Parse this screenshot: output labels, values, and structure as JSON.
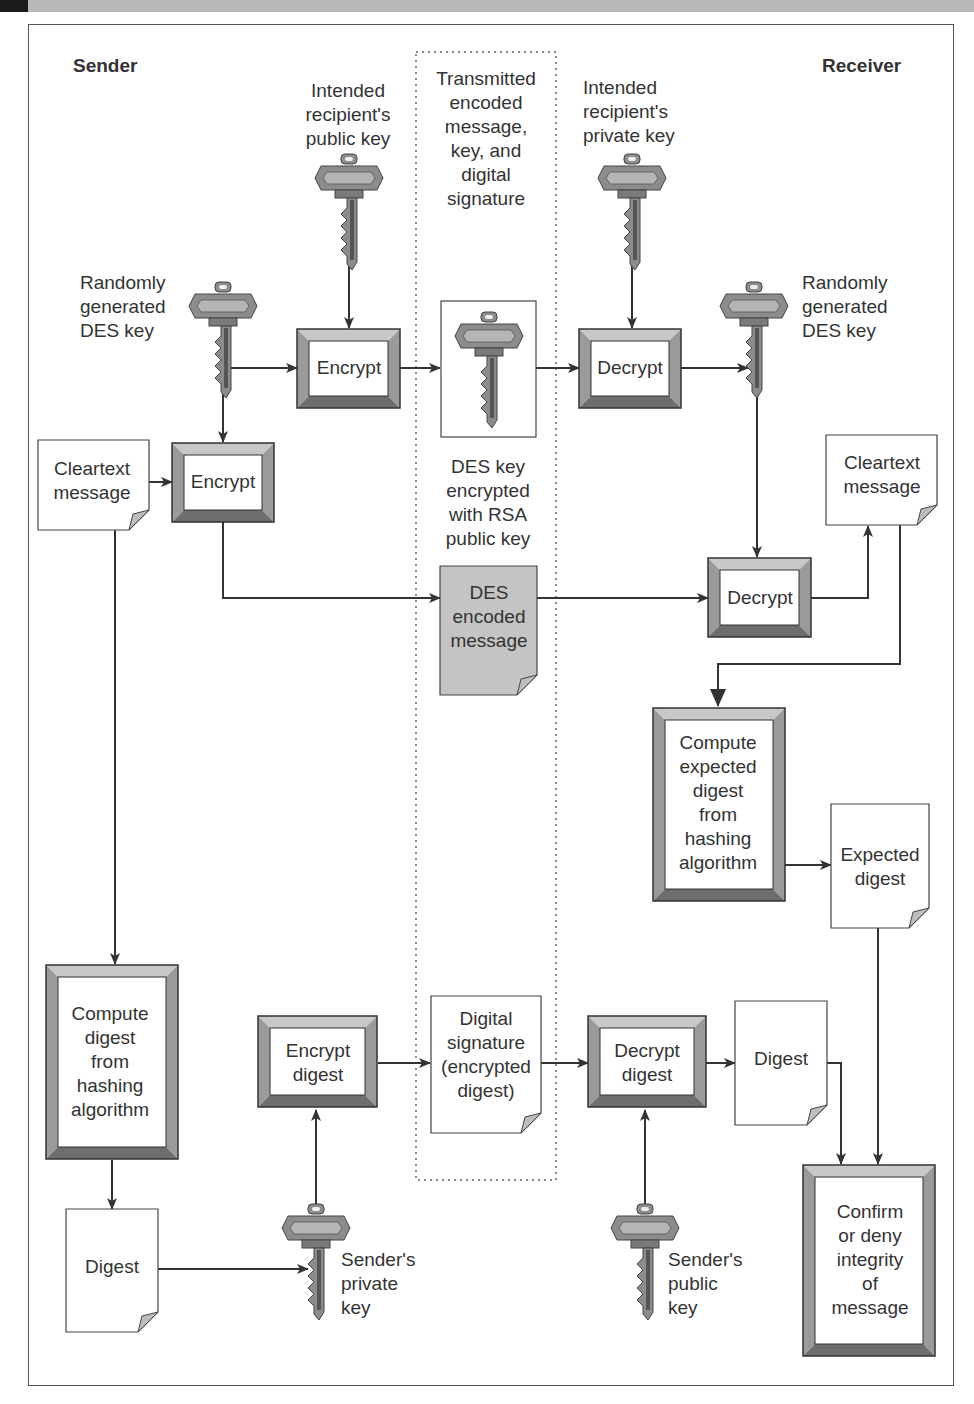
{
  "header": {
    "sender": "Sender",
    "receiver": "Receiver"
  },
  "colors": {
    "bevel_top": "#c8c8c8",
    "bevel_side": "#9a9a9a",
    "bevel_bottom": "#6e6e6e",
    "line": "#333333",
    "key_fill": "#8c8c8c",
    "shaded_doc": "#c4c4c4",
    "fold": "#bdbdbd"
  },
  "transmitted": {
    "label": "Transmitted\nencoded\nmessage,\nkey, and\ndigital\nsignature"
  },
  "keys": [
    {
      "id": "k_pub_recipient",
      "label": "Intended\nrecipient's\npublic key"
    },
    {
      "id": "k_priv_recipient",
      "label": "Intended\nrecipient's\nprivate key"
    },
    {
      "id": "k_des_sender",
      "label": "Randomly\ngenerated\nDES key"
    },
    {
      "id": "k_des_receiver",
      "label": "Randomly\ngenerated\nDES key"
    },
    {
      "id": "k_des_encrypted",
      "label": "DES key\nencrypted\nwith RSA\npublic key"
    },
    {
      "id": "k_sender_private",
      "label": "Sender's\nprivate\nkey"
    },
    {
      "id": "k_sender_public",
      "label": "Sender's\npublic\nkey"
    }
  ],
  "processes": [
    {
      "id": "p_encrypt_key",
      "label": "Encrypt"
    },
    {
      "id": "p_decrypt_key",
      "label": "Decrypt"
    },
    {
      "id": "p_encrypt_msg",
      "label": "Encrypt"
    },
    {
      "id": "p_decrypt_msg",
      "label": "Decrypt"
    },
    {
      "id": "p_compute_expected",
      "label": "Compute\nexpected\ndigest\nfrom\nhashing\nalgorithm"
    },
    {
      "id": "p_compute_digest",
      "label": "Compute\ndigest\nfrom\nhashing\nalgorithm"
    },
    {
      "id": "p_encrypt_digest",
      "label": "Encrypt\ndigest"
    },
    {
      "id": "p_decrypt_digest",
      "label": "Decrypt\ndigest"
    },
    {
      "id": "p_confirm",
      "label": "Confirm\nor deny\nintegrity\nof\nmessage"
    }
  ],
  "documents": [
    {
      "id": "d_cleartext_sender",
      "label": "Cleartext\nmessage"
    },
    {
      "id": "d_cleartext_receiver",
      "label": "Cleartext\nmessage"
    },
    {
      "id": "d_des_encoded",
      "label": "DES\nencoded\nmessage"
    },
    {
      "id": "d_expected_digest",
      "label": "Expected\ndigest"
    },
    {
      "id": "d_digital_signature",
      "label": "Digital\nsignature\n(encrypted\ndigest)"
    },
    {
      "id": "d_digest_receiver",
      "label": "Digest"
    },
    {
      "id": "d_digest_sender",
      "label": "Digest"
    }
  ]
}
